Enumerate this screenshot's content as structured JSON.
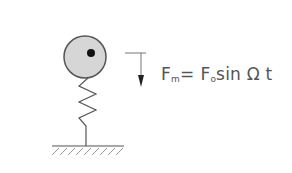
{
  "diagram": {
    "type": "spring-mass system with harmonic forcing",
    "mass": {
      "shape": "circle",
      "fill": "#d6d6d6",
      "stroke": "#555555",
      "center_dot": true
    },
    "spring": {
      "coils": 3,
      "stroke": "#555555"
    },
    "ground": {
      "hatched": true
    },
    "force_arrow": {
      "direction": "down"
    },
    "formula": {
      "lhs_symbol": "F",
      "lhs_subscript": "m",
      "equals": "=",
      "rhs_symbol": "F",
      "rhs_subscript": "o",
      "function": "sin",
      "omega": "Ω",
      "time": "t"
    }
  }
}
